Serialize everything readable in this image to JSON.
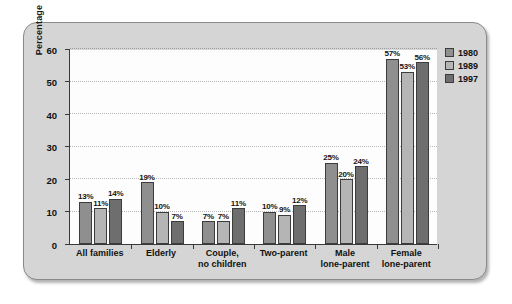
{
  "chart_data": {
    "type": "bar",
    "title": "",
    "subtitle": "",
    "xlabel": "",
    "ylabel": "Percentage",
    "ylim": [
      0,
      60
    ],
    "ytick_values": [
      0,
      10,
      20,
      30,
      40,
      50,
      60
    ],
    "ytick_labels": [
      "0",
      "10",
      "20",
      "30",
      "40",
      "50",
      "60"
    ],
    "grid": true,
    "grid_axis": "y",
    "legend_position": "top-right",
    "value_label_suffix": "%",
    "categories": [
      "All families",
      "Elderly",
      "Couple, no children",
      "Two-parent",
      "Male lone-parent",
      "Female lone-parent"
    ],
    "category_lines": [
      [
        "All families"
      ],
      [
        "Elderly"
      ],
      [
        "Couple,",
        "no children"
      ],
      [
        "Two-parent"
      ],
      [
        "Male",
        "lone-parent"
      ],
      [
        "Female",
        "lone-parent"
      ]
    ],
    "series": [
      {
        "name": "1980",
        "color": "#8f8f8f",
        "values": [
          13,
          19,
          7,
          10,
          25,
          57
        ],
        "labels": [
          "13%",
          "19%",
          "7%",
          "10%",
          "25%",
          "57%"
        ]
      },
      {
        "name": "1989",
        "color": "#b5b5b5",
        "values": [
          11,
          10,
          7,
          9,
          20,
          53
        ],
        "labels": [
          "11%",
          "10%",
          "7%",
          "9%",
          "20%",
          "53%"
        ]
      },
      {
        "name": "1997",
        "color": "#6e6e6e",
        "values": [
          14,
          7,
          11,
          12,
          24,
          56
        ],
        "labels": [
          "14%",
          "7%",
          "11%",
          "12%",
          "24%",
          "56%"
        ]
      }
    ]
  },
  "legend": {
    "items": [
      {
        "label": "1980",
        "color": "#8f8f8f"
      },
      {
        "label": "1989",
        "color": "#b5b5b5"
      },
      {
        "label": "1997",
        "color": "#6e6e6e"
      }
    ]
  },
  "panel": {
    "background_color": "#d5d5d5",
    "border_color": "#8a8a8a",
    "plot_background_color": "#fdfdfd",
    "axis_color": "#3a3a3a",
    "gridline_color": "#b8b8b8"
  }
}
